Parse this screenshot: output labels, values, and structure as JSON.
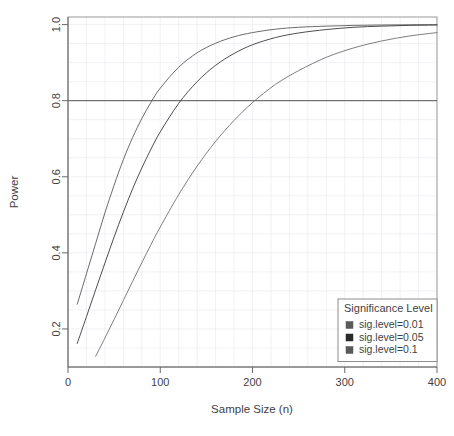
{
  "chart_data": {
    "type": "line",
    "title": "",
    "xlabel": "Sample Size (n)",
    "ylabel": "Power",
    "xlim": [
      0,
      400
    ],
    "ylim": [
      0.1,
      1.02
    ],
    "xticks": [
      0,
      100,
      200,
      300,
      400
    ],
    "yticks": [
      0.2,
      0.4,
      0.6,
      0.8,
      1.0
    ],
    "ytick_labels": [
      "0.2",
      "0.4",
      "0.6",
      "0.8",
      "1.0"
    ],
    "xtick_labels": [
      "0",
      "100",
      "200",
      "300",
      "400"
    ],
    "grid": true,
    "grid_color": "#e8e8ef",
    "legend_position": "bottom-right",
    "reference_lines": [
      {
        "name": "power-0.8-threshold",
        "orientation": "horizontal",
        "y": 0.8,
        "color": "#555555"
      }
    ],
    "series": [
      {
        "name": "sig.level=0.01",
        "color": "#5a5a5a",
        "x": [
          10,
          20,
          30,
          40,
          50,
          60,
          70,
          80,
          90,
          100,
          120,
          140,
          160,
          180,
          200,
          225,
          250,
          280,
          310,
          340,
          370,
          400
        ],
        "y": [
          0.265,
          0.345,
          0.425,
          0.505,
          0.578,
          0.645,
          0.703,
          0.753,
          0.796,
          0.833,
          0.888,
          0.926,
          0.951,
          0.968,
          0.979,
          0.988,
          0.993,
          0.996,
          0.998,
          0.999,
          0.9995,
          0.9998
        ]
      },
      {
        "name": "sig.level=0.05",
        "color": "#3a3a3a",
        "x": [
          10,
          20,
          30,
          40,
          50,
          60,
          70,
          80,
          90,
          100,
          120,
          140,
          160,
          180,
          200,
          225,
          250,
          280,
          310,
          340,
          370,
          400
        ],
        "y": [
          0.162,
          0.232,
          0.303,
          0.373,
          0.442,
          0.507,
          0.568,
          0.623,
          0.673,
          0.718,
          0.793,
          0.85,
          0.893,
          0.924,
          0.947,
          0.966,
          0.978,
          0.987,
          0.993,
          0.996,
          0.998,
          0.999
        ]
      },
      {
        "name": "sig.level=0.1",
        "color": "#6f6f6f",
        "x": [
          30,
          40,
          50,
          60,
          70,
          80,
          90,
          100,
          120,
          140,
          160,
          180,
          200,
          225,
          250,
          280,
          310,
          340,
          370,
          400
        ],
        "y": [
          0.128,
          0.176,
          0.225,
          0.275,
          0.325,
          0.374,
          0.422,
          0.468,
          0.553,
          0.628,
          0.693,
          0.748,
          0.795,
          0.843,
          0.879,
          0.914,
          0.939,
          0.957,
          0.97,
          0.979
        ]
      }
    ],
    "legend": {
      "title": "Significance Level",
      "entries": [
        {
          "label": "sig.level=0.01",
          "color": "#5a5a5a"
        },
        {
          "label": "sig.level=0.05",
          "color": "#2b2b2b"
        },
        {
          "label": "sig.level=0.1",
          "color": "#5a5a5a"
        }
      ]
    }
  }
}
